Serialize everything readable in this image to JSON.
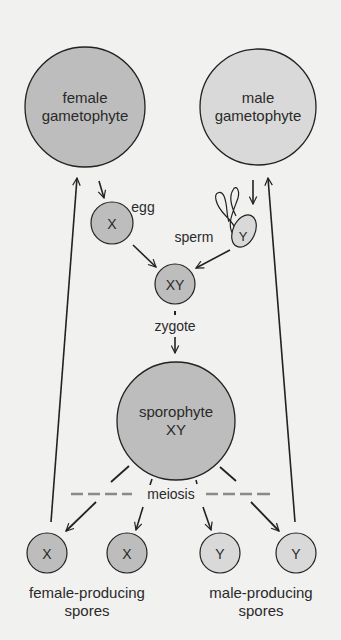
{
  "colors": {
    "background": "#f1f1f0",
    "female_fill": "#bdbdbd",
    "male_fill": "#d9d9d9",
    "stroke": "#222222",
    "meiosis_dash": "#8a8a8a"
  },
  "nodes": {
    "female_gametophyte": {
      "line1": "female",
      "line2": "gametophyte"
    },
    "male_gametophyte": {
      "line1": "male",
      "line2": "gametophyte"
    },
    "egg": {
      "symbol": "X",
      "label": "egg"
    },
    "sperm": {
      "symbol": "Y",
      "label": "sperm"
    },
    "zygote": {
      "symbol": "XY",
      "label": "zygote"
    },
    "sporophyte": {
      "line1": "sporophyte",
      "line2": "XY"
    },
    "meiosis": {
      "label": "meiosis"
    },
    "spores": [
      {
        "symbol": "X",
        "type": "female"
      },
      {
        "symbol": "X",
        "type": "female"
      },
      {
        "symbol": "Y",
        "type": "male"
      },
      {
        "symbol": "Y",
        "type": "male"
      }
    ],
    "female_spores_label": {
      "line1": "female-producing",
      "line2": "spores"
    },
    "male_spores_label": {
      "line1": "male-producing",
      "line2": "spores"
    }
  }
}
